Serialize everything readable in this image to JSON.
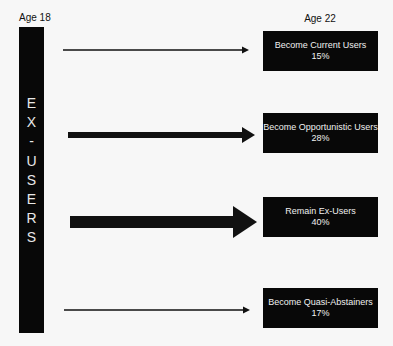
{
  "left_label": "Age 18",
  "right_label": "Age 22",
  "source": {
    "letters": [
      "E",
      "X",
      "-",
      "U",
      "S",
      "E",
      "R",
      "S"
    ],
    "full_text": "EX-USERS"
  },
  "outcomes": [
    {
      "label": "Become Current Users",
      "percent": "15%",
      "arrow_weight": "thin"
    },
    {
      "label": "Become Opportunistic Users",
      "percent": "28%",
      "arrow_weight": "medium"
    },
    {
      "label": "Remain Ex-Users",
      "percent": "40%",
      "arrow_weight": "thick"
    },
    {
      "label": "Become Quasi-Abstainers",
      "percent": "17%",
      "arrow_weight": "thin"
    }
  ],
  "colors": {
    "background": "#f7f7f7",
    "box": "#080808",
    "box_text": "#f0f0f0",
    "arrow": "#111111"
  }
}
